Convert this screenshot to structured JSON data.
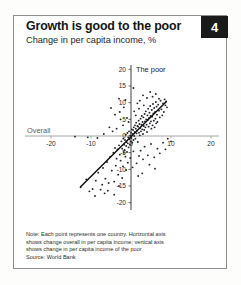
{
  "figure": {
    "number": "4",
    "title": "Growth is good to the poor",
    "subtitle": "Change in per capita income, %",
    "note_lines": [
      "Note: Each point represents one country. Horizontal axis",
      "shows change overall in per capita income; vertical axis",
      "shows change in per capita income of the poor"
    ],
    "source": "Source: World Bank",
    "colors": {
      "badge_background": "#1a1a1a",
      "badge_text": "#ffffff",
      "accent_bar": "#9a9a9a",
      "point": "#23232a",
      "fit_line": "#111111",
      "axis": "#8e8e8e",
      "frame": "#8d8d8d"
    }
  },
  "chart_data": {
    "type": "scatter",
    "title": "Growth is good to the poor",
    "subtitle": "Change in per capita income, %",
    "xlabel": "Overall",
    "ylabel": "The poor",
    "xlim": [
      -22,
      22
    ],
    "ylim": [
      -21,
      21
    ],
    "xticks": [
      -20,
      -10,
      0,
      10,
      20
    ],
    "xticklabels": [
      "-20",
      "-10",
      "0",
      "10",
      "20"
    ],
    "yticks": [
      -20,
      -15,
      -10,
      -5,
      0,
      5,
      10,
      15,
      20
    ],
    "yticklabels": [
      "-20",
      "-15",
      "-10",
      "-5",
      "0",
      "5",
      "10",
      "15",
      "20"
    ],
    "grid": false,
    "legend": null,
    "fit_line": {
      "label": "regression line",
      "x": [
        -12.6,
        8.8
      ],
      "y": [
        -15.2,
        10.3
      ]
    },
    "points": [
      [
        -12.6,
        -15.4
      ],
      [
        -11.2,
        -13.0
      ],
      [
        -10.4,
        -16.6
      ],
      [
        -9.6,
        -15.9
      ],
      [
        -8.8,
        -13.4
      ],
      [
        -8.2,
        -11.0
      ],
      [
        -7.6,
        -16.1
      ],
      [
        -7.0,
        -9.6
      ],
      [
        -6.4,
        -12.8
      ],
      [
        -6.0,
        -7.8
      ],
      [
        -5.6,
        -14.1
      ],
      [
        -5.2,
        -6.2
      ],
      [
        -4.8,
        -10.4
      ],
      [
        -4.4,
        -5.0
      ],
      [
        -4.2,
        -13.7
      ],
      [
        -4.0,
        -3.6
      ],
      [
        -3.8,
        -8.9
      ],
      [
        -3.6,
        -6.8
      ],
      [
        -3.4,
        -4.0
      ],
      [
        -3.2,
        -11.6
      ],
      [
        -3.0,
        -2.8
      ],
      [
        -2.8,
        -5.6
      ],
      [
        -2.6,
        -7.4
      ],
      [
        -2.4,
        -1.6
      ],
      [
        -2.2,
        -3.8
      ],
      [
        -2.0,
        -9.1
      ],
      [
        -1.9,
        -0.8
      ],
      [
        -1.8,
        -5.0
      ],
      [
        -1.7,
        -2.6
      ],
      [
        -1.6,
        -4.2
      ],
      [
        -1.5,
        -1.2
      ],
      [
        -1.4,
        -6.2
      ],
      [
        -1.3,
        0.4
      ],
      [
        -1.2,
        -3.0
      ],
      [
        -1.1,
        -1.8
      ],
      [
        -1.0,
        -4.8
      ],
      [
        -0.9,
        0.9
      ],
      [
        -0.8,
        -2.2
      ],
      [
        -0.7,
        -0.4
      ],
      [
        -0.6,
        -3.4
      ],
      [
        -0.5,
        1.4
      ],
      [
        -0.4,
        -1.0
      ],
      [
        -0.3,
        -2.6
      ],
      [
        -0.2,
        0.2
      ],
      [
        -0.1,
        -1.6
      ],
      [
        0.0,
        1.0
      ],
      [
        0.1,
        -0.6
      ],
      [
        0.2,
        2.0
      ],
      [
        0.3,
        -2.0
      ],
      [
        0.4,
        0.6
      ],
      [
        0.5,
        1.8
      ],
      [
        0.6,
        -1.2
      ],
      [
        0.7,
        2.6
      ],
      [
        0.8,
        0.0
      ],
      [
        0.9,
        1.2
      ],
      [
        1.0,
        3.2
      ],
      [
        1.1,
        -0.8
      ],
      [
        1.2,
        2.2
      ],
      [
        1.3,
        4.0
      ],
      [
        1.4,
        0.8
      ],
      [
        1.5,
        1.6
      ],
      [
        1.6,
        3.0
      ],
      [
        1.7,
        -1.8
      ],
      [
        1.8,
        2.8
      ],
      [
        1.9,
        4.6
      ],
      [
        2.0,
        1.0
      ],
      [
        2.1,
        3.6
      ],
      [
        2.2,
        0.2
      ],
      [
        2.3,
        2.4
      ],
      [
        2.4,
        5.2
      ],
      [
        2.5,
        1.4
      ],
      [
        2.6,
        3.4
      ],
      [
        2.7,
        6.0
      ],
      [
        2.8,
        2.0
      ],
      [
        2.9,
        4.2
      ],
      [
        3.0,
        0.6
      ],
      [
        3.1,
        5.6
      ],
      [
        3.2,
        3.0
      ],
      [
        3.3,
        1.8
      ],
      [
        3.4,
        6.6
      ],
      [
        3.5,
        4.4
      ],
      [
        3.6,
        2.6
      ],
      [
        3.7,
        7.4
      ],
      [
        3.8,
        5.0
      ],
      [
        3.9,
        3.4
      ],
      [
        4.0,
        1.2
      ],
      [
        4.1,
        6.2
      ],
      [
        4.2,
        4.8
      ],
      [
        4.3,
        8.2
      ],
      [
        4.4,
        2.8
      ],
      [
        4.5,
        5.4
      ],
      [
        4.6,
        7.0
      ],
      [
        4.7,
        3.8
      ],
      [
        4.8,
        9.0
      ],
      [
        4.9,
        6.0
      ],
      [
        5.0,
        4.4
      ],
      [
        5.1,
        2.2
      ],
      [
        5.2,
        7.8
      ],
      [
        5.3,
        5.8
      ],
      [
        5.4,
        3.2
      ],
      [
        5.5,
        9.6
      ],
      [
        5.6,
        6.8
      ],
      [
        5.7,
        4.6
      ],
      [
        5.8,
        8.4
      ],
      [
        5.9,
        2.6
      ],
      [
        6.0,
        7.2
      ],
      [
        6.1,
        5.2
      ],
      [
        6.2,
        10.2
      ],
      [
        6.3,
        3.8
      ],
      [
        6.4,
        8.8
      ],
      [
        6.5,
        6.4
      ],
      [
        6.6,
        4.2
      ],
      [
        6.8,
        9.4
      ],
      [
        7.0,
        7.6
      ],
      [
        7.2,
        5.6
      ],
      [
        7.4,
        10.6
      ],
      [
        7.6,
        8.0
      ],
      [
        7.8,
        6.2
      ],
      [
        8.0,
        9.8
      ],
      [
        8.2,
        7.2
      ],
      [
        8.4,
        11.0
      ],
      [
        8.6,
        9.2
      ],
      [
        8.8,
        10.4
      ],
      [
        9.0,
        8.6
      ],
      [
        -3.0,
        11.2
      ],
      [
        -1.4,
        10.8
      ],
      [
        0.6,
        14.4
      ],
      [
        1.6,
        9.8
      ],
      [
        2.2,
        10.6
      ],
      [
        3.0,
        12.2
      ],
      [
        4.0,
        11.4
      ],
      [
        4.8,
        13.2
      ],
      [
        5.4,
        11.8
      ],
      [
        6.2,
        12.6
      ],
      [
        7.0,
        11.2
      ],
      [
        0.8,
        7.4
      ],
      [
        1.2,
        6.2
      ],
      [
        2.0,
        8.2
      ],
      [
        3.2,
        9.2
      ],
      [
        -0.6,
        4.2
      ],
      [
        -1.0,
        5.4
      ],
      [
        -2.0,
        3.2
      ],
      [
        -2.6,
        5.0
      ],
      [
        -3.6,
        2.2
      ],
      [
        -4.6,
        1.4
      ],
      [
        -5.4,
        2.6
      ],
      [
        -6.8,
        0.6
      ],
      [
        -8.4,
        -0.6
      ],
      [
        -10.8,
        -0.4
      ],
      [
        -14.0,
        -0.2
      ],
      [
        -5.0,
        8.4
      ],
      [
        -4.0,
        6.4
      ],
      [
        -2.8,
        7.2
      ],
      [
        -1.8,
        8.6
      ],
      [
        2.4,
        -4.4
      ],
      [
        3.4,
        -3.2
      ],
      [
        4.2,
        -5.8
      ],
      [
        5.0,
        -2.4
      ],
      [
        5.8,
        -6.4
      ],
      [
        6.6,
        -3.8
      ],
      [
        7.2,
        -5.2
      ],
      [
        8.0,
        -2.0
      ],
      [
        4.6,
        -8.6
      ],
      [
        6.0,
        -9.8
      ],
      [
        3.0,
        -7.0
      ],
      [
        2.0,
        -6.0
      ],
      [
        1.4,
        -8.2
      ],
      [
        0.6,
        -4.6
      ],
      [
        -0.2,
        -6.6
      ],
      [
        -0.8,
        -8.0
      ],
      [
        9.2,
        -0.8
      ],
      [
        10.0,
        -1.6
      ],
      [
        8.6,
        -4.0
      ],
      [
        2.8,
        -11.2
      ],
      [
        1.8,
        -12.0
      ],
      [
        0.4,
        -9.4
      ],
      [
        -1.2,
        -10.2
      ],
      [
        -2.2,
        -12.6
      ],
      [
        -5.8,
        -16.4
      ],
      [
        -6.6,
        -17.2
      ],
      [
        -9.0,
        -18.0
      ],
      [
        -7.2,
        -14.6
      ],
      [
        -3.0,
        -15.0
      ],
      [
        -4.2,
        -17.6
      ]
    ]
  }
}
